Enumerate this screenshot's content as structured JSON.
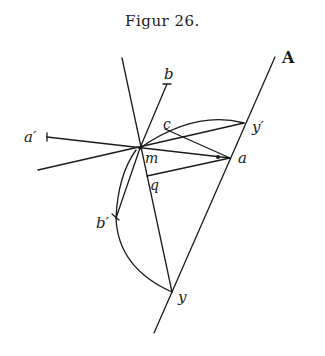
{
  "figure": {
    "title": "Figur 26.",
    "labels": {
      "A": "A",
      "b": "b",
      "a_prime": "a′",
      "c": "c",
      "y_prime": "y′",
      "m": "m",
      "a": "a",
      "q": "q",
      "b_prime": "b′",
      "y": "y"
    },
    "stroke_color": "#1a1a1a"
  }
}
